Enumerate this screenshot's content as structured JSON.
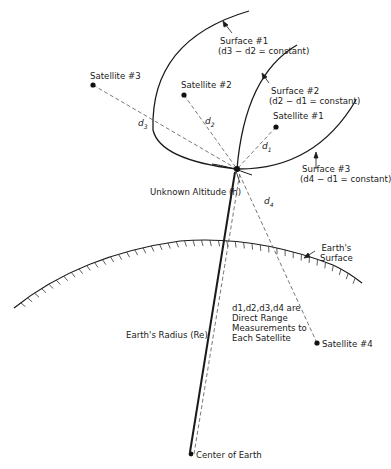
{
  "diagram": {
    "title": "",
    "satellites": [
      {
        "id": "sat1",
        "label": "Satellite #1",
        "x": 276,
        "y": 127
      },
      {
        "id": "sat2",
        "label": "Satellite #2",
        "x": 184,
        "y": 95
      },
      {
        "id": "sat3",
        "label": "Satellite #3",
        "x": 93,
        "y": 85
      },
      {
        "id": "sat4",
        "label": "Satellite #4",
        "x": 317,
        "y": 343
      }
    ],
    "receiver": {
      "x": 237,
      "y": 169
    },
    "center_of_earth": {
      "label": "Center of Earth",
      "x": 190,
      "y": 454
    },
    "distances": [
      {
        "label": "d1",
        "base": "d",
        "sub": "1"
      },
      {
        "label": "d2",
        "base": "d",
        "sub": "2"
      },
      {
        "label": "d3",
        "base": "d",
        "sub": "3"
      },
      {
        "label": "d4",
        "base": "d",
        "sub": "4"
      }
    ],
    "surfaces": [
      {
        "label": "Surface #1",
        "equation": "(d3 − d2 = constant)"
      },
      {
        "label": "Surface #2",
        "equation": "(d2 − d1 = constant)"
      },
      {
        "label": "Surface #3",
        "equation": "(d4 − d1 = constant)"
      }
    ],
    "labels": {
      "unknown_altitude": "Unknown Altitude (h)",
      "earths_surface_line1": "Earth's",
      "earths_surface_line2": "Surface",
      "earths_radius": "Earth's Radius (Re)",
      "note_line1": "d1,d2,d3,d4 are",
      "note_line2": "Direct Range",
      "note_line3": "Measurements to",
      "note_line4": "Each Satellite"
    },
    "colors": {
      "stroke": "#1a1a1a",
      "dashed": "#555555",
      "background": "#ffffff"
    }
  }
}
